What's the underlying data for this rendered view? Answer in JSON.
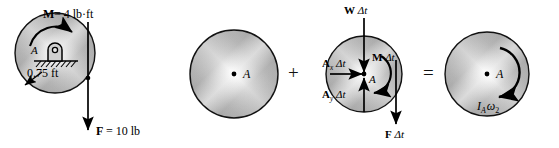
{
  "figure": {
    "operators": {
      "plus": "+",
      "equals": "="
    },
    "colors": {
      "metal_light": "#f2f2f2",
      "metal_mid": "#b9b9b9",
      "metal_dark": "#8f8f8f",
      "outline": "#1a1a1a",
      "ink": "#000000"
    }
  },
  "diagrams": [
    {
      "id": "free-body-diagram",
      "center_label": "A",
      "labels": {
        "moment": "M = 4 lb·ft",
        "moment_symbol": "M",
        "moment_value": "= 4 lb·ft",
        "radius": "0.75 ft",
        "force": "F = 10 lb",
        "force_symbol": "F",
        "force_value": "= 10 lb"
      },
      "support": "pin-support-with-ground-hatching"
    },
    {
      "id": "initial-momentum-diagram",
      "center_label": "A",
      "labels": {}
    },
    {
      "id": "impulse-diagram",
      "center_label": "A",
      "labels": {
        "weight_impulse": "W Δt",
        "weight_symbol": "W",
        "weight_dt": "Δt",
        "moment_impulse": "M Δt",
        "moment_symbol": "M",
        "moment_dt": "Δt",
        "reaction_x": "A",
        "reaction_x_sub": "x",
        "reaction_x_dt": "Δt",
        "reaction_y": "A",
        "reaction_y_sub": "y",
        "reaction_y_dt": "Δt",
        "force_impulse": "F Δt",
        "force_symbol": "F",
        "force_dt": "Δt"
      }
    },
    {
      "id": "final-momentum-diagram",
      "center_label": "A",
      "labels": {
        "angular_momentum_I": "I",
        "angular_momentum_I_sub": "A",
        "angular_momentum_omega": "ω",
        "angular_momentum_omega_sub": "2"
      }
    }
  ]
}
